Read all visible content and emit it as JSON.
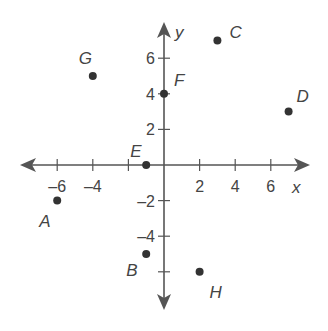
{
  "chart_data": {
    "type": "scatter",
    "title": "",
    "xlabel": "x",
    "ylabel": "y",
    "xlim": [
      -8.5,
      8.5
    ],
    "ylim": [
      -8.5,
      8.5
    ],
    "grid": false,
    "x_ticks": [
      -6,
      -4,
      -2,
      2,
      4,
      6
    ],
    "y_ticks": [
      6,
      4,
      2,
      -2,
      -4,
      -6
    ],
    "x_tick_labels": [
      "–6",
      "–4",
      "",
      "2",
      "4",
      "6"
    ],
    "y_tick_labels": [
      "6",
      "4",
      "2",
      "–2",
      "–4",
      ""
    ],
    "points": [
      {
        "label": "A",
        "x": -6,
        "y": -2
      },
      {
        "label": "B",
        "x": -1,
        "y": -5
      },
      {
        "label": "C",
        "x": 3,
        "y": 7
      },
      {
        "label": "D",
        "x": 7,
        "y": 3
      },
      {
        "label": "E",
        "x": -1,
        "y": 0
      },
      {
        "label": "F",
        "x": 0,
        "y": 4
      },
      {
        "label": "G",
        "x": -4,
        "y": 5
      },
      {
        "label": "H",
        "x": 2,
        "y": -6
      }
    ]
  },
  "layout": {
    "origin_px": [
      164,
      165
    ],
    "unit_px": 17.8,
    "label_offsets": {
      "A": [
        -18,
        26
      ],
      "B": [
        -20,
        22
      ],
      "C": [
        12,
        -2
      ],
      "D": [
        8,
        -10
      ],
      "E": [
        -16,
        -8
      ],
      "F": [
        10,
        -8
      ],
      "G": [
        -14,
        -12
      ],
      "H": [
        10,
        26
      ]
    }
  }
}
